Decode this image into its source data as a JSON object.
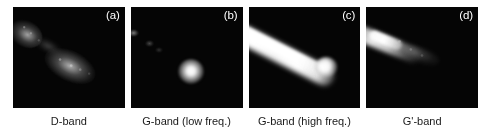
{
  "figure": {
    "type": "raman-band-intensity-maps",
    "panel_count": 4,
    "background_color": "#ffffff",
    "panel_background_color": "#050505",
    "label_color": "#ffffff",
    "caption_color": "#1a1a1a"
  },
  "panels": [
    {
      "letter": "(a)",
      "caption": "D-band",
      "signal_description": "faint granular diagonal streak, two clusters, upper-left to center",
      "relative_brightness": "low"
    },
    {
      "letter": "(b)",
      "caption": "G-band (low freq.)",
      "signal_description": "single bright compact round blob below center, faint specks upper-left",
      "relative_brightness": "medium"
    },
    {
      "letter": "(c)",
      "caption": "G-band (high freq.)",
      "signal_description": "thick bright continuous diagonal band, upper-left to lower-right",
      "relative_brightness": "high"
    },
    {
      "letter": "(d)",
      "caption": "G'-band",
      "signal_description": "moderate diagonal streak confined to upper-left quadrant",
      "relative_brightness": "medium"
    }
  ]
}
